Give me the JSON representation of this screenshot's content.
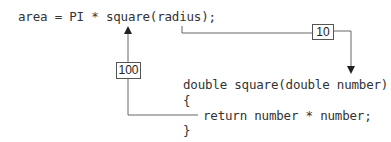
{
  "diagram": {
    "call_statement": "area = PI * square(radius);",
    "function_lines": [
      "double square(double number)",
      "{",
      "return number * number;",
      "}"
    ],
    "argument_value_box": "10",
    "return_value_box": "100"
  }
}
